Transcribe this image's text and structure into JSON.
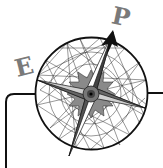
{
  "logo": {
    "description": "Compass rose logo",
    "letters": {
      "left": "E",
      "top_right": "P"
    },
    "colors": {
      "stroke": "#111111",
      "letter": "#7a7a7a",
      "fill_gray": "#9a9a9a",
      "background": "#ffffff"
    }
  }
}
